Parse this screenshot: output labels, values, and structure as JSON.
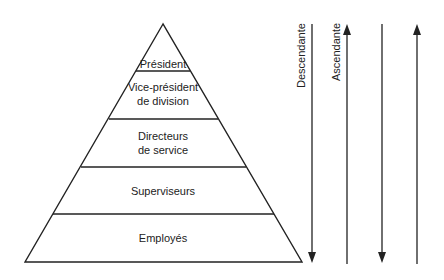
{
  "pyramid": {
    "levels": [
      {
        "label": "Président"
      },
      {
        "label": "Vice-président",
        "label2": "de division"
      },
      {
        "label": "Directeurs",
        "label2": "de service"
      },
      {
        "label": "Superviseurs"
      },
      {
        "label": "Employés"
      }
    ]
  },
  "arrows": {
    "descending_label": "Descendante",
    "ascending_label": "Ascendante"
  },
  "colors": {
    "line": "#222222",
    "background": "#ffffff"
  }
}
